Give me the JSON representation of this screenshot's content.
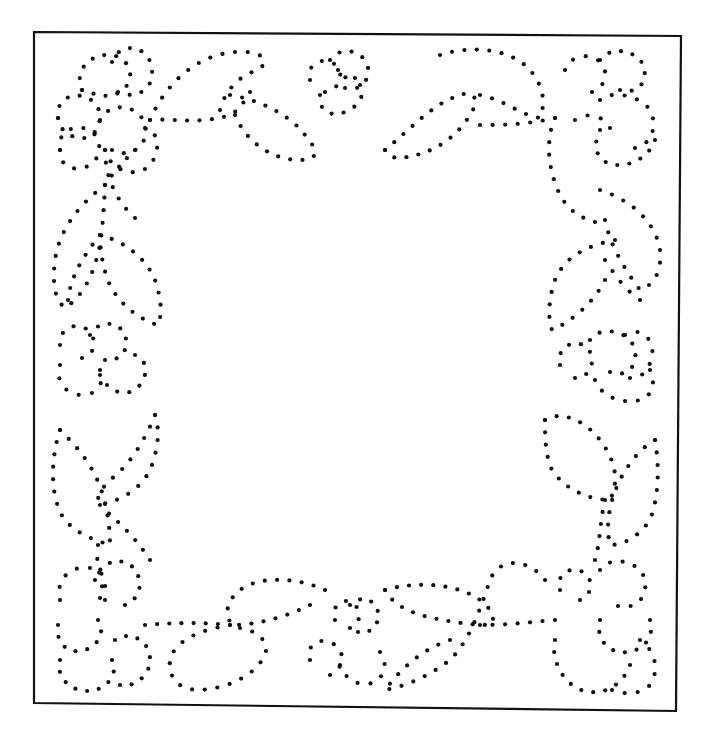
{
  "image": {
    "width": 708,
    "height": 745,
    "background": "#ffffff",
    "ink_color": "#111111",
    "description": "Dotted floral border pattern inside a rectangular frame"
  },
  "frame": {
    "points": [
      [
        34,
        32
      ],
      [
        681,
        36
      ],
      [
        676,
        711
      ],
      [
        34,
        703
      ]
    ]
  },
  "dot": {
    "radius": 2.1,
    "spacing": 12.5
  },
  "motifs": [
    {
      "name": "flower-top-left-petal-a",
      "path": "M82,90 C70,60 110,45 125,62 C140,80 120,100 100,95 C90,93 84,92 82,90"
    },
    {
      "name": "flower-top-left-petal-b",
      "path": "M112,62 C120,40 150,45 152,70 C154,90 135,100 118,92"
    },
    {
      "name": "flower-top-left-petal-c",
      "path": "M58,118 C55,90 90,90 98,108 C104,122 95,140 80,138 C65,136 60,128 58,118"
    },
    {
      "name": "flower-top-left-petal-d",
      "path": "M60,150 C55,125 90,120 98,140 C104,158 88,172 72,168 C62,165 60,158 60,150"
    },
    {
      "name": "flower-top-left-petal-e",
      "path": "M100,120 C110,100 140,105 145,125 C150,145 130,160 112,150"
    },
    {
      "name": "flower-top-left-petal-f",
      "path": "M105,150 C110,170 135,180 150,165 C162,150 158,130 145,128"
    },
    {
      "name": "stem-top-left-down",
      "path": "M105,150 C105,175 115,200 135,218"
    },
    {
      "name": "stem-top-left-right",
      "path": "M150,120 C170,118 200,125 230,115 C240,110 245,100 250,92"
    },
    {
      "name": "leaf-top-1",
      "path": "M150,120 C165,85 195,55 235,52 C265,50 270,62 258,70 C240,75 225,90 220,110"
    },
    {
      "name": "leaf-top-2",
      "path": "M230,95 C260,100 290,115 305,135 C318,150 320,160 300,160 C270,160 245,140 235,115"
    },
    {
      "name": "flower-top-center-a",
      "path": "M310,80 C305,60 330,55 338,68 C344,78 338,90 325,92"
    },
    {
      "name": "flower-top-center-b",
      "path": "M330,60 C340,45 365,50 368,68 C370,82 358,92 345,88"
    },
    {
      "name": "flower-top-center-c",
      "path": "M320,95 C318,110 330,118 345,112 C360,106 365,95 360,85"
    },
    {
      "name": "flower-top-center-d",
      "path": "M338,70 C345,78 350,82 355,78"
    },
    {
      "name": "leaf-top-3",
      "path": "M385,150 C410,130 430,105 460,95 C475,90 480,100 470,115 C455,140 430,155 400,158 C392,158 388,155 385,150"
    },
    {
      "name": "leaf-top-4",
      "path": "M440,55 C470,45 510,48 530,70 C545,88 545,105 540,118 C520,115 505,100 480,95"
    },
    {
      "name": "stem-top-right-left",
      "path": "M480,125 C500,125 525,125 555,118"
    },
    {
      "name": "flower-top-right-a",
      "path": "M565,70 C570,55 590,52 600,62 C610,72 605,88 592,92"
    },
    {
      "name": "flower-top-right-b",
      "path": "M600,60 C610,45 640,50 644,68 C648,84 635,95 620,90"
    },
    {
      "name": "flower-top-right-c",
      "path": "M600,100 C610,90 640,95 650,110 C658,125 652,145 635,148"
    },
    {
      "name": "flower-top-right-d",
      "path": "M600,130 C590,150 600,165 618,165 C635,165 650,155 655,140"
    },
    {
      "name": "flower-top-right-e",
      "path": "M575,120 C590,110 605,118 610,128"
    },
    {
      "name": "stem-top-right-down",
      "path": "M555,118 C545,140 548,170 560,195 C568,210 580,218 595,222"
    },
    {
      "name": "leaf-right-1",
      "path": "M600,190 C630,200 655,220 660,250 C662,270 655,285 640,290 C625,270 610,245 605,220"
    },
    {
      "name": "leaf-right-2",
      "path": "M615,240 C590,245 565,255 555,280 C548,300 548,320 552,330 C575,320 595,300 605,280"
    },
    {
      "name": "stem-right-mid-1",
      "path": "M605,260 C615,275 625,290 640,300"
    },
    {
      "name": "flower-right-mid-a",
      "path": "M560,365 C555,345 580,335 590,352 C596,365 588,378 575,378"
    },
    {
      "name": "flower-right-mid-b",
      "path": "M590,340 C600,325 630,330 635,350 C638,368 625,378 610,372"
    },
    {
      "name": "flower-right-mid-c",
      "path": "M625,335 C640,325 655,340 652,355 C650,370 640,380 630,378"
    },
    {
      "name": "flower-right-mid-d",
      "path": "M595,380 C600,395 620,405 640,400 C655,395 655,380 650,370"
    },
    {
      "name": "leaf-right-3",
      "path": "M545,420 C560,410 585,420 600,440 C615,460 620,480 610,500 C590,500 565,490 552,470 C545,455 545,435 545,420"
    },
    {
      "name": "leaf-right-4",
      "path": "M655,440 C660,470 658,500 650,520 C640,535 625,545 610,545 C605,525 610,500 620,480 C630,460 645,445 655,440"
    },
    {
      "name": "stem-right-low",
      "path": "M605,500 C600,520 600,545 595,560"
    },
    {
      "name": "flower-bottom-right-a",
      "path": "M560,590 C555,575 570,565 583,572 C595,580 592,595 580,600"
    },
    {
      "name": "flower-bottom-right-b",
      "path": "M600,570 C610,555 640,560 645,580 C648,598 635,610 618,606"
    },
    {
      "name": "flower-bottom-right-c",
      "path": "M600,620 C595,640 610,655 628,652 C645,650 655,635 650,620"
    },
    {
      "name": "flower-bottom-right-d",
      "path": "M555,640 C550,660 565,690 590,692 C610,694 625,680 630,665"
    },
    {
      "name": "flower-bottom-right-e",
      "path": "M640,640 C655,650 660,670 650,685 C640,695 625,695 612,690"
    },
    {
      "name": "stem-bottom-right-left",
      "path": "M555,620 C530,622 510,625 480,625"
    },
    {
      "name": "leaf-bottom-1",
      "path": "M545,580 C530,560 500,555 490,580 C480,610 470,640 450,660 C430,675 410,685 385,690 C400,670 420,650 450,640"
    },
    {
      "name": "leaf-bottom-2",
      "path": "M385,590 C420,580 460,585 480,600 C495,612 495,620 490,625 C465,625 440,620 420,615 C400,608 390,600 385,590"
    },
    {
      "name": "flower-bottom-center-a",
      "path": "M335,620 C330,605 345,595 355,605 C362,612 360,625 350,628"
    },
    {
      "name": "flower-bottom-center-b",
      "path": "M350,605 C360,595 375,598 378,612 C380,625 370,635 358,632"
    },
    {
      "name": "flower-bottom-center-c",
      "path": "M310,660 C305,645 320,635 335,645 C345,652 345,668 330,675"
    },
    {
      "name": "flower-bottom-center-d",
      "path": "M340,665 C345,680 360,688 375,682 C385,676 388,662 380,652"
    },
    {
      "name": "leaf-bottom-3",
      "path": "M325,590 C300,578 260,575 240,590 C225,602 225,615 232,625 C260,625 290,615 310,605"
    },
    {
      "name": "leaf-bottom-4",
      "path": "M230,625 C200,630 175,640 170,660 C168,680 180,690 200,690 C230,688 255,675 265,655 C270,640 255,630 240,628"
    },
    {
      "name": "stem-bottom-left-right",
      "path": "M145,625 C170,623 200,622 230,625"
    },
    {
      "name": "flower-bottom-left-a",
      "path": "M60,600 C55,580 70,565 90,568 C105,570 110,585 100,598"
    },
    {
      "name": "flower-bottom-left-b",
      "path": "M95,580 C100,560 125,555 135,570 C145,585 138,600 125,605"
    },
    {
      "name": "flower-bottom-left-c",
      "path": "M58,625 C55,645 70,655 85,650 C100,645 105,630 98,620"
    },
    {
      "name": "flower-bottom-left-d",
      "path": "M60,660 C55,680 75,695 95,690 C110,686 118,672 112,660"
    },
    {
      "name": "flower-bottom-left-e",
      "path": "M115,640 C130,630 150,640 150,660 C150,675 135,688 120,685"
    },
    {
      "name": "stem-bottom-left-up",
      "path": "M105,600 C100,575 95,560 98,545"
    },
    {
      "name": "leaf-left-low-1",
      "path": "M60,430 C50,460 50,500 65,520 C78,535 95,540 110,545 C110,520 105,495 95,475 C85,455 70,440 60,430"
    },
    {
      "name": "leaf-left-low-2",
      "path": "M155,415 C145,440 130,465 110,480 C100,490 95,500 100,505 C125,500 145,485 152,465 C158,448 160,430 155,415"
    },
    {
      "name": "stem-left-low",
      "path": "M100,505 C115,520 130,530 150,560"
    },
    {
      "name": "flower-left-mid-a",
      "path": "M60,345 C58,330 75,320 88,330 C98,340 95,355 82,358"
    },
    {
      "name": "flower-left-mid-b",
      "path": "M90,335 C98,320 118,320 125,335 C130,350 120,362 105,360"
    },
    {
      "name": "flower-left-mid-c",
      "path": "M60,365 C55,380 65,395 82,395 C98,395 105,382 100,370"
    },
    {
      "name": "flower-left-mid-d",
      "path": "M100,375 C110,395 130,398 140,385 C150,372 145,358 135,355"
    },
    {
      "name": "leaf-left-mid-1",
      "path": "M105,185 C85,200 60,225 55,260 C52,285 55,300 65,308 C85,295 95,270 100,245 C103,225 104,205 105,185"
    },
    {
      "name": "leaf-left-mid-2",
      "path": "M100,235 C120,240 145,255 155,280 C162,300 162,315 158,325 C140,320 120,305 110,285 C103,270 100,250 100,235"
    },
    {
      "name": "stem-left-mid",
      "path": "M105,185 C115,170 125,160 135,150"
    },
    {
      "name": "stem-left-mid-2",
      "path": "M100,235 C80,260 70,280 68,300"
    }
  ]
}
